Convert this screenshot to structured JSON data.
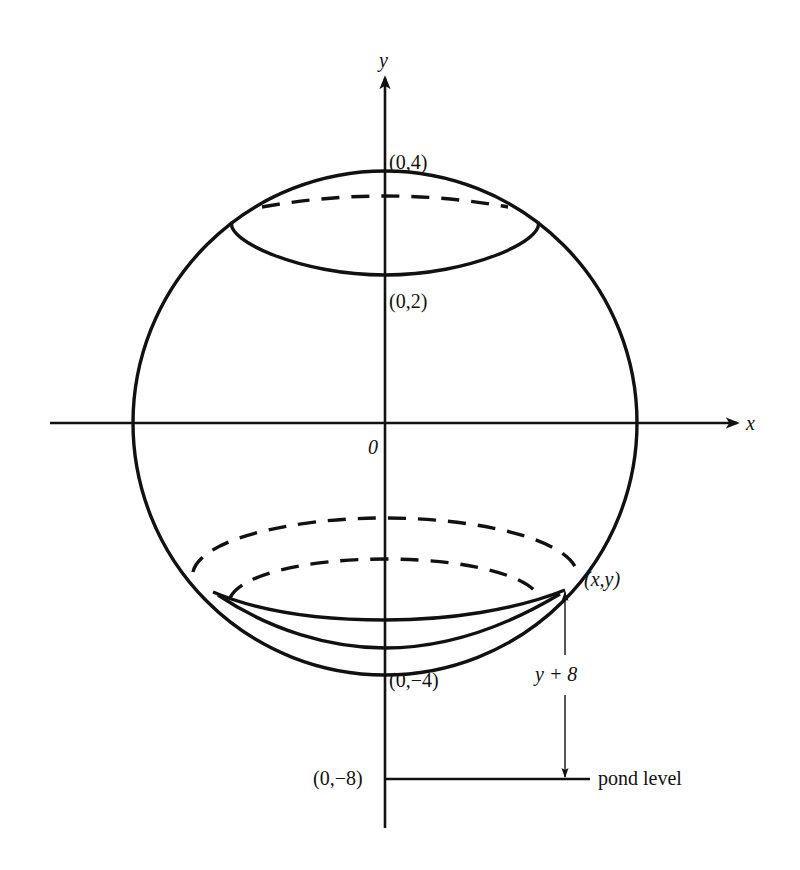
{
  "figure": {
    "type": "geometric-diagram",
    "colors": {
      "ink": "#111111",
      "background": "#ffffff"
    },
    "axes": {
      "x_label": "x",
      "y_label": "y",
      "origin_label": "0"
    },
    "points": {
      "top": "(0,4)",
      "cap_bottom": "(0,2)",
      "bottom": "(0,−4)",
      "pond": "(0,−8)",
      "slice_point": "(x,y)"
    },
    "annotations": {
      "height_label": "y + 8",
      "pond_label": "pond level"
    },
    "geometry": {
      "sphere_radius": 4,
      "sphere_center": [
        0,
        0
      ],
      "pond_level_y": -8,
      "top_cap_slice_y": 2
    }
  }
}
